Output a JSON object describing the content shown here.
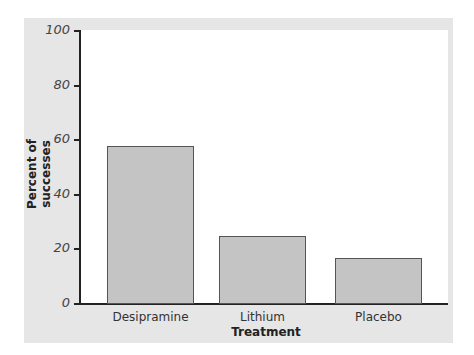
{
  "chart_data": {
    "type": "bar",
    "title": "",
    "xlabel": "Treatment",
    "ylabel": "Percent of successes",
    "categories": [
      "Desipramine",
      "Lithium",
      "Placebo"
    ],
    "values": [
      58,
      25,
      17
    ],
    "ylim": [
      0,
      100
    ],
    "yticks": [
      "0",
      "20",
      "40",
      "60",
      "80",
      "100"
    ],
    "grid": false,
    "legend": null
  },
  "colors": {
    "bar_fill": "#c4c4c4",
    "bar_border": "#555555",
    "panel_background": "#e6e6e6",
    "plot_background": "#ffffff"
  }
}
